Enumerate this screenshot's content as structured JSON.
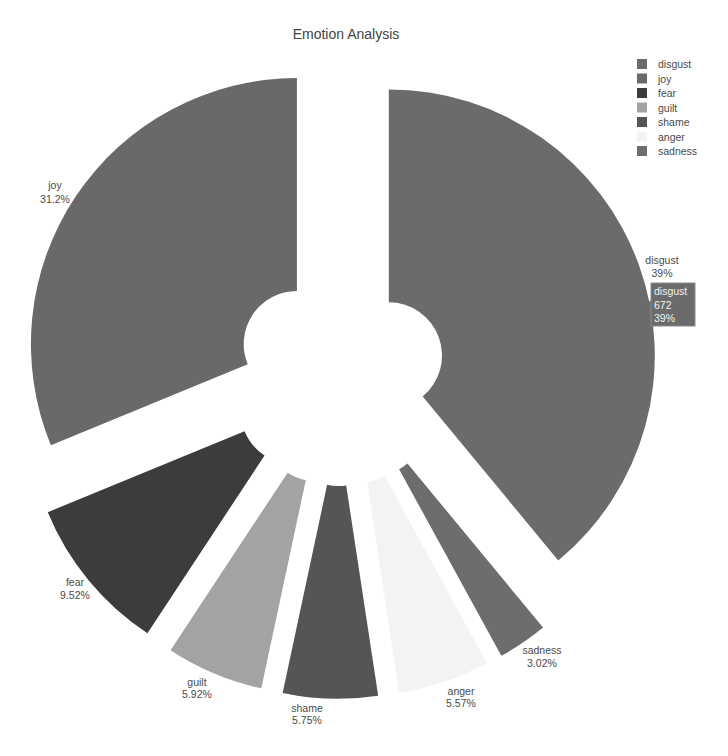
{
  "title": "Emotion Analysis",
  "chart_data": {
    "type": "pie",
    "title": "Emotion Analysis",
    "labels": [
      "disgust",
      "joy",
      "fear",
      "guilt",
      "shame",
      "anger",
      "sadness"
    ],
    "values": [
      39,
      31.2,
      9.52,
      5.92,
      5.75,
      5.57,
      3.02
    ],
    "text": [
      "39%",
      "31.2%",
      "9.52%",
      "5.92%",
      "5.75%",
      "5.57%",
      "3.02%"
    ],
    "colors": [
      "#6b6b6b",
      "#696969",
      "#3c3c3c",
      "#a3a3a3",
      "#555555",
      "#f3f3f3",
      "#6d6d6d"
    ],
    "hole": 0.2,
    "pull": [
      0.195,
      0.195,
      0.225,
      0.225,
      0.225,
      0.225,
      0.225
    ],
    "direction": "counterclockwise",
    "textinfo": "label+percent",
    "textposition": "outside",
    "legend_position": "top-right"
  },
  "hover": {
    "label": "disgust",
    "value": "672",
    "percent": "39%"
  }
}
